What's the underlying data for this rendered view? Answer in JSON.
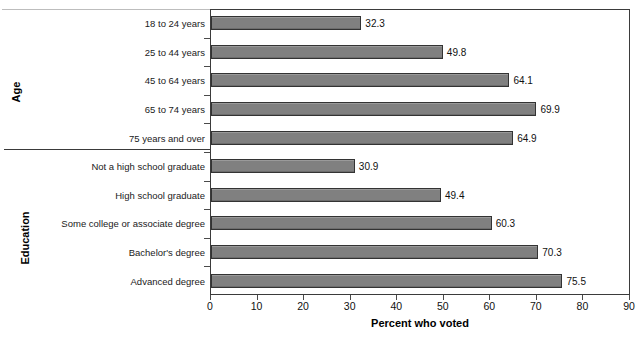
{
  "chart_data": {
    "type": "bar",
    "orientation": "horizontal",
    "title": "",
    "xlabel": "Percent who voted",
    "ylabel": "",
    "xlim": [
      0,
      90
    ],
    "xticks": [
      0,
      10,
      20,
      30,
      40,
      50,
      60,
      70,
      80,
      90
    ],
    "grid": false,
    "legend": null,
    "bar_color": "#808080",
    "bar_edge_color": "#333333",
    "groups": [
      {
        "name": "Age",
        "categories": [
          "18 to 24 years",
          "25 to 44 years",
          "45 to 64 years",
          "65 to 74 years",
          "75 years and over"
        ],
        "values": [
          32.3,
          49.8,
          64.1,
          69.9,
          64.9
        ]
      },
      {
        "name": "Education",
        "categories": [
          "Not a high school graduate",
          "High school graduate",
          "Some college or associate degree",
          "Bachelor's degree",
          "Advanced degree"
        ],
        "values": [
          30.9,
          49.4,
          60.3,
          70.3,
          75.5
        ]
      }
    ],
    "categories": [
      "18 to 24 years",
      "25 to 44 years",
      "45 to 64 years",
      "65 to 74 years",
      "75 years and over",
      "Not a high school graduate",
      "High school graduate",
      "Some college or associate degree",
      "Bachelor's degree",
      "Advanced degree"
    ],
    "values": [
      32.3,
      49.8,
      64.1,
      69.9,
      64.9,
      30.9,
      49.4,
      60.3,
      70.3,
      75.5
    ],
    "value_labels": [
      "32.3",
      "49.8",
      "64.1",
      "69.9",
      "64.9",
      "30.9",
      "49.4",
      "60.3",
      "70.3",
      "75.5"
    ]
  },
  "axis": {
    "x_title": "Percent who voted",
    "group_labels": {
      "age": "Age",
      "education": "Education"
    },
    "tick_labels": [
      "0",
      "10",
      "20",
      "30",
      "40",
      "50",
      "60",
      "70",
      "80",
      "90"
    ]
  }
}
